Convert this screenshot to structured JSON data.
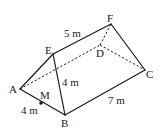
{
  "diagram": {
    "type": "triangular-prism",
    "vertices": {
      "A": {
        "label": "A",
        "x": 20,
        "y": 89
      },
      "B": {
        "label": "B",
        "x": 65,
        "y": 115
      },
      "C": {
        "label": "C",
        "x": 145,
        "y": 70
      },
      "D": {
        "label": "D",
        "x": 100,
        "y": 45
      },
      "E": {
        "label": "E",
        "x": 53,
        "y": 54
      },
      "F": {
        "label": "F",
        "x": 111,
        "y": 24
      }
    },
    "point_M": {
      "label": "M",
      "x": 41,
      "y": 103
    },
    "measurements": {
      "EF": "5 m",
      "EB": "4 m",
      "BC": "7 m",
      "AB": "4 m"
    },
    "edges_solid": [
      "AE",
      "AB",
      "EB",
      "EF",
      "FC",
      "BC"
    ],
    "edges_hidden": [
      "AD",
      "DC",
      "DF"
    ]
  }
}
